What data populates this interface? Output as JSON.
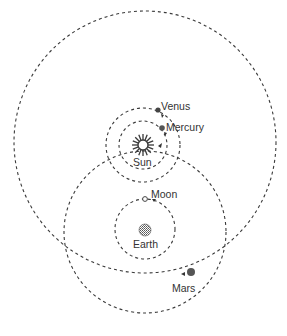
{
  "diagram": {
    "type": "tychonic-system",
    "colors": {
      "line": "#3a3a3a",
      "text": "#333333",
      "planet": "#555555",
      "background": "#ffffff"
    },
    "bodies": {
      "sun": {
        "label": "Sun",
        "icon": "sun-icon"
      },
      "earth": {
        "label": "Earth",
        "icon": "earth-icon"
      },
      "moon": {
        "label": "Moon",
        "icon": "moon-icon"
      },
      "mercury": {
        "label": "Mercury",
        "icon": "mercury-icon"
      },
      "venus": {
        "label": "Venus",
        "icon": "venus-icon"
      },
      "mars": {
        "label": "Mars",
        "icon": "mars-icon"
      }
    },
    "orbits": [
      {
        "name": "mars-orbit",
        "center": "sun"
      },
      {
        "name": "sun-orbit",
        "center": "earth"
      },
      {
        "name": "moon-orbit",
        "center": "earth"
      },
      {
        "name": "venus-orbit",
        "center": "sun"
      },
      {
        "name": "mercury-orbit",
        "center": "sun"
      }
    ]
  }
}
